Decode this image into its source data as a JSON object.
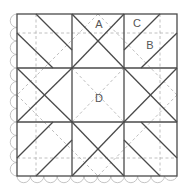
{
  "diagram": {
    "type": "quilt-block-pattern",
    "grid": "3x3",
    "labels": [
      {
        "id": "A",
        "text": "A",
        "x": 99,
        "y": 24
      },
      {
        "id": "C",
        "text": "C",
        "x": 137,
        "y": 23
      },
      {
        "id": "B",
        "text": "B",
        "x": 150,
        "y": 45
      },
      {
        "id": "D",
        "text": "D",
        "x": 99,
        "y": 98
      }
    ],
    "colors": {
      "solid_line": "#4a4a4a",
      "dashed_line": "#b0b0b0",
      "scallop": "#bdbdbd",
      "label": "#555555",
      "background": "#ffffff"
    }
  }
}
